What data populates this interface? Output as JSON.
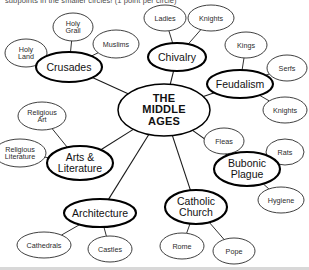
{
  "header": {
    "instruction": "subpoints in the smaller circles! (1 point per circle)"
  },
  "diagram": {
    "type": "concept-map",
    "center": {
      "id": "middle-ages",
      "label": "THE\nMIDDLE\nAGES",
      "cx": 164,
      "cy": 110,
      "rx": 46,
      "ry": 26
    },
    "branches": [
      {
        "id": "crusades",
        "label": "Crusades",
        "cx": 69,
        "cy": 67,
        "rx": 33,
        "ry": 15,
        "children": [
          {
            "id": "holy-grail",
            "label": "Holy\nGrail",
            "cx": 73,
            "cy": 27,
            "rx": 20,
            "ry": 14
          },
          {
            "id": "holy-land",
            "label": "Holy\nLand",
            "cx": 26,
            "cy": 53,
            "rx": 21,
            "ry": 14
          },
          {
            "id": "muslims",
            "label": "Muslims",
            "cx": 116,
            "cy": 44,
            "rx": 23,
            "ry": 14
          }
        ]
      },
      {
        "id": "chivalry",
        "label": "Chivalry",
        "cx": 177,
        "cy": 57,
        "rx": 29,
        "ry": 14
      },
      {
        "id": "feudalism",
        "label": "Feudalism",
        "cx": 240,
        "cy": 84,
        "rx": 33,
        "ry": 14,
        "children": [
          {
            "id": "kings",
            "label": "Kings",
            "cx": 246,
            "cy": 45,
            "rx": 21,
            "ry": 13
          },
          {
            "id": "serfs",
            "label": "Serfs",
            "cx": 287,
            "cy": 68,
            "rx": 20,
            "ry": 13
          },
          {
            "id": "knights-feudal",
            "label": "Knights",
            "cx": 285,
            "cy": 110,
            "rx": 22,
            "ry": 13
          }
        ]
      },
      {
        "id": "bubonic-plague",
        "label": "Bubonic\nPlague",
        "cx": 247,
        "cy": 169,
        "rx": 33,
        "ry": 17,
        "children": [
          {
            "id": "fleas",
            "label": "Fleas",
            "cx": 224,
            "cy": 141,
            "rx": 20,
            "ry": 13
          },
          {
            "id": "rats",
            "label": "Rats",
            "cx": 285,
            "cy": 152,
            "rx": 19,
            "ry": 13
          },
          {
            "id": "hygiene",
            "label": "Hygiene",
            "cx": 281,
            "cy": 200,
            "rx": 23,
            "ry": 13
          }
        ]
      },
      {
        "id": "catholic-church",
        "label": "Catholic\nChurch",
        "cx": 196,
        "cy": 207,
        "rx": 31,
        "ry": 17,
        "children": [
          {
            "id": "rome",
            "label": "Rome",
            "cx": 182,
            "cy": 246,
            "rx": 22,
            "ry": 13
          },
          {
            "id": "pope",
            "label": "Pope",
            "cx": 234,
            "cy": 251,
            "rx": 21,
            "ry": 13
          }
        ]
      },
      {
        "id": "architecture",
        "label": "Architecture",
        "cx": 100,
        "cy": 213,
        "rx": 36,
        "ry": 14,
        "children": [
          {
            "id": "cathedrals",
            "label": "Cathedrals",
            "cx": 44,
            "cy": 245,
            "rx": 27,
            "ry": 13
          },
          {
            "id": "castles",
            "label": "Castles",
            "cx": 110,
            "cy": 249,
            "rx": 22,
            "ry": 13
          }
        ]
      },
      {
        "id": "arts-literature",
        "label": "Arts &\nLiterature",
        "cx": 80,
        "cy": 163,
        "rx": 33,
        "ry": 17,
        "children": [
          {
            "id": "religious-art",
            "label": "Religious\nArt",
            "cx": 42,
            "cy": 116,
            "rx": 24,
            "ry": 14
          },
          {
            "id": "religious-literature",
            "label": "Religious\nLiterature",
            "cx": 20,
            "cy": 153,
            "rx": 26,
            "ry": 14
          }
        ]
      }
    ],
    "shared_children": [
      {
        "id": "ladies",
        "label": "Ladies",
        "cx": 165,
        "cy": 18,
        "rx": 21,
        "ry": 13,
        "parent": "chivalry"
      },
      {
        "id": "knights-chivalry",
        "label": "Knights",
        "cx": 211,
        "cy": 18,
        "rx": 23,
        "ry": 13,
        "parent": "chivalry"
      }
    ],
    "colors": {
      "stroke": "#000000",
      "minor_stroke": "#2a2a2a",
      "background": "#ffffff",
      "header_text": "#4a4a4a"
    }
  }
}
